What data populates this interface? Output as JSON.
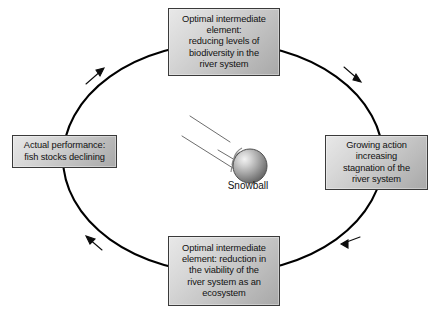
{
  "diagram": {
    "type": "causal-loop",
    "direction": "clockwise",
    "title_visible": false,
    "background_color": "#ffffff",
    "path_color": "#000000",
    "box_border_color": "#3a3a3a",
    "box_fill_gradient": [
      "#e8e8e8",
      "#a8a8a8"
    ],
    "nodes": [
      {
        "id": "top",
        "position": "top",
        "text": "Optimal intermediate\nelement:\nreducing levels of\nbiodiversity in the\nriver system"
      },
      {
        "id": "right",
        "position": "right",
        "text": "Growing action\nincreasing\nstagnation of the\nriver system"
      },
      {
        "id": "bottom",
        "position": "bottom",
        "text": "Optimal intermediate\nelement: reduction in\nthe viability of the\nriver system as an\necosystem"
      },
      {
        "id": "left",
        "position": "left",
        "text": "Actual performance:\nfish stocks declining"
      }
    ],
    "center": {
      "label": "Snowball",
      "icon": "snowball-sphere-icon",
      "trail_lines": 3
    },
    "arrows": [
      {
        "id": "top-left-arrow",
        "points": "up-right"
      },
      {
        "id": "top-right-arrow",
        "points": "down-right"
      },
      {
        "id": "bottom-right-arrow",
        "points": "left"
      },
      {
        "id": "bottom-left-arrow",
        "points": "up-left"
      }
    ]
  }
}
